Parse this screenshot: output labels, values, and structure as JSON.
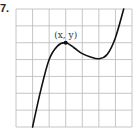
{
  "problem_number": "7.",
  "point_label": "(x, y)",
  "colors": {
    "grid": "#b8b8b8",
    "curve": "#111111",
    "text": "#222222"
  },
  "chart_data": {
    "type": "line",
    "title": "",
    "xlabel": "",
    "ylabel": "",
    "grid": true,
    "grid_columns": 7,
    "grid_rows": 7,
    "annotations": [
      {
        "text": "(x, y)",
        "at": "local maximum"
      }
    ],
    "x": [
      1.0,
      1.5,
      2.0,
      2.5,
      3.0,
      3.5,
      4.0,
      4.5,
      5.0,
      5.5,
      6.0,
      6.5
    ],
    "values": [
      0.0,
      2.2,
      4.0,
      4.8,
      5.0,
      4.7,
      4.35,
      4.15,
      4.05,
      4.3,
      5.3,
      7.0
    ],
    "xlim": [
      0,
      7
    ],
    "ylim": [
      0,
      7
    ],
    "key_points": {
      "local_max": {
        "x": 3,
        "y": 5
      },
      "local_min": {
        "x": 5,
        "y": 4
      }
    }
  }
}
